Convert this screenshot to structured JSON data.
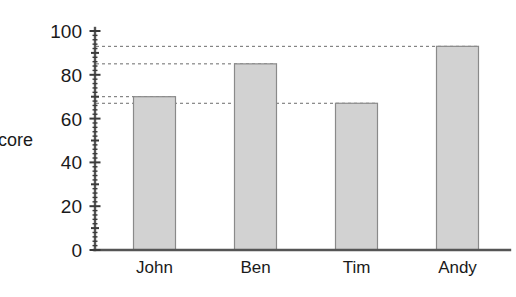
{
  "chart_data": {
    "type": "bar",
    "title": "",
    "subtitle": "",
    "xlabel": "",
    "ylabel": "core",
    "ylabel_full_hint": "core",
    "categories": [
      "John",
      "Ben",
      "Tim",
      "Andy"
    ],
    "values": [
      70,
      85,
      67,
      93
    ],
    "series": [
      {
        "name": "Score",
        "values": [
          70,
          85,
          67,
          93
        ]
      }
    ],
    "ylim": [
      0,
      100
    ],
    "xlim_note": "categorical",
    "y_major_ticks": [
      0,
      20,
      40,
      60,
      80,
      100
    ],
    "y_major_tick_labels": [
      "0",
      "20",
      "40",
      "60",
      "80",
      "100"
    ],
    "y_minor_tick_interval": 2,
    "y_medium_tick_interval": 10,
    "grid": false,
    "legend": "none",
    "legend_position": "none",
    "annotations": [
      {
        "label": "guide line at 93",
        "value": 93,
        "from_axis": true,
        "to_category": "Andy"
      },
      {
        "label": "guide line at 85",
        "value": 85,
        "from_axis": true,
        "to_category": "Ben"
      },
      {
        "label": "guide line at 70",
        "value": 70,
        "from_axis": true,
        "to_category": "John"
      },
      {
        "label": "guide line at 67",
        "value": 67,
        "from_axis": true,
        "to_category": "Tim"
      }
    ],
    "colors": {
      "bar_fill": "#d2d2d2",
      "bar_edge": "#8a8a8a",
      "axis": "#555555",
      "text": "#1a1a1a",
      "guide": "#6b6b6b",
      "background": "#ffffff"
    }
  }
}
